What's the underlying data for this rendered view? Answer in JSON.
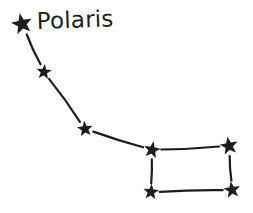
{
  "drawing": {
    "background_color": "#ffffff",
    "ink_color": "#1d1d1d",
    "line_width": 2.2,
    "gap": 2.5,
    "label": {
      "text": "Polaris",
      "x": 37,
      "y": 29,
      "font_size": 23,
      "rotation": -2
    },
    "stars": [
      {
        "name": "polaris",
        "x": 22,
        "y": 24,
        "r": 9.0,
        "rotation": -12
      },
      {
        "name": "handle-2",
        "x": 44,
        "y": 72,
        "r": 6.0,
        "rotation": 6
      },
      {
        "name": "handle-3",
        "x": 85,
        "y": 129,
        "r": 6.2,
        "rotation": -6
      },
      {
        "name": "bowl-top-left",
        "x": 152,
        "y": 150,
        "r": 6.8,
        "rotation": 10
      },
      {
        "name": "bowl-top-right",
        "x": 229,
        "y": 146,
        "r": 7.5,
        "rotation": -10
      },
      {
        "name": "bowl-bottom-left",
        "x": 151,
        "y": 192,
        "r": 6.2,
        "rotation": 5
      },
      {
        "name": "bowl-bottom-right",
        "x": 232,
        "y": 190,
        "r": 6.8,
        "rotation": -8
      }
    ],
    "edges": [
      {
        "from": 0,
        "to": 1,
        "bow": 1.2
      },
      {
        "from": 1,
        "to": 2,
        "bow": -1.5
      },
      {
        "from": 2,
        "to": 3,
        "bow": 1.0
      },
      {
        "from": 3,
        "to": 4,
        "bow": 1.2
      },
      {
        "from": 3,
        "to": 5,
        "bow": -0.8
      },
      {
        "from": 4,
        "to": 6,
        "bow": 1.0
      },
      {
        "from": 5,
        "to": 6,
        "bow": -1.2
      }
    ]
  }
}
